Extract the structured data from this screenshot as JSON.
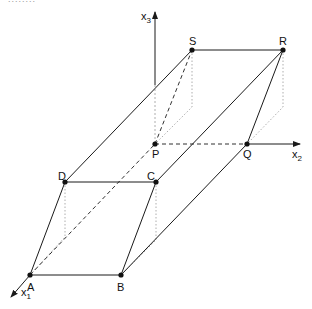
{
  "header": {
    "clipped_text": "........"
  },
  "diagram": {
    "axes": [
      {
        "name": "x",
        "sub": "1"
      },
      {
        "name": "x",
        "sub": "2"
      },
      {
        "name": "x",
        "sub": "3"
      }
    ],
    "points": {
      "A": "A",
      "B": "B",
      "C": "C",
      "D": "D",
      "P": "P",
      "Q": "Q",
      "R": "R",
      "S": "S"
    },
    "line_color": "#1a1a1a",
    "dotted_color": "#999999"
  }
}
